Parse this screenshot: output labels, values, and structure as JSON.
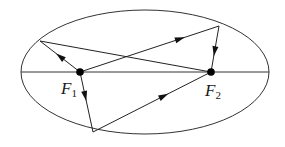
{
  "diagram": {
    "type": "ellipse-reflection",
    "ellipse": {
      "cx": 145,
      "cy": 72,
      "rx": 124,
      "ry": 62
    },
    "major_axis": {
      "x1": 21,
      "y1": 72,
      "x2": 269,
      "y2": 72
    },
    "foci": [
      {
        "id": "F1",
        "x": 80,
        "y": 72,
        "label": "F",
        "subscript": "1"
      },
      {
        "id": "F2",
        "x": 211,
        "y": 72,
        "label": "F",
        "subscript": "2"
      }
    ],
    "rays": [
      {
        "from": "F1",
        "to": [
          40,
          41
        ],
        "arrow_pos": 0.5
      },
      {
        "from": [
          40,
          41
        ],
        "to": "F2",
        "arrow_pos": null
      },
      {
        "from": "F1",
        "to": [
          219,
          26
        ],
        "arrow_pos": 0.72
      },
      {
        "from": [
          219,
          26
        ],
        "to": "F2",
        "arrow_pos": 0.55
      },
      {
        "from": "F1",
        "to": [
          93,
          132
        ],
        "arrow_pos": 0.4
      },
      {
        "from": [
          93,
          132
        ],
        "to": "F2",
        "arrow_pos": 0.6
      }
    ],
    "stroke_color": "#1a1a1a"
  }
}
